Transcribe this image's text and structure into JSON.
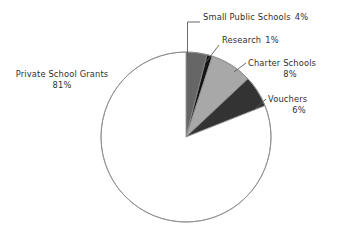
{
  "chart_data": {
    "type": "pie",
    "title": "",
    "subtitle": "",
    "xlabel": "",
    "ylabel": "",
    "legend_position": "none",
    "grid": false,
    "value_unit": "%",
    "start_angle_deg": 0,
    "direction": "clockwise",
    "categories": [
      "Small Public Schools",
      "Research",
      "Charter Schools",
      "Vouchers",
      "Private School Grants"
    ],
    "values": [
      4,
      1,
      8,
      6,
      81
    ],
    "slices": [
      {
        "label": "Small Public Schools",
        "value": 4,
        "value_text": "4%",
        "color": "#666666",
        "leader": "elbow"
      },
      {
        "label": "Research",
        "value": 1,
        "value_text": "1%",
        "color": "#141414",
        "leader": "diagonal"
      },
      {
        "label": "Charter Schools",
        "value": 8,
        "value_text": "8%",
        "color": "#a8a8a8",
        "leader": "diagonal"
      },
      {
        "label": "Vouchers",
        "value": 6,
        "value_text": "6%",
        "color": "#333333",
        "leader": "diagonal"
      },
      {
        "label": "Private School Grants",
        "value": 81,
        "value_text": "81%",
        "color": "#ffffff",
        "leader": "none"
      }
    ]
  },
  "colors": {
    "background": "#ffffff",
    "outline": "#8c8c8c",
    "leader_line": "#5a5a5a",
    "text": "#2f2f2f"
  },
  "geometry": {
    "center_x": 186,
    "center_y": 137,
    "radius": 85
  }
}
